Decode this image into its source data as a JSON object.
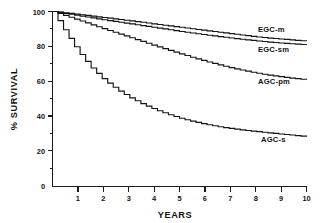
{
  "chart_data": {
    "type": "line",
    "title": "",
    "subtitle": "",
    "xlabel": "YEARS",
    "ylabel": "% SURVIVAL",
    "xlim": [
      0,
      10
    ],
    "ylim": [
      0,
      100
    ],
    "grid": false,
    "legend_position": "inline-right-of-curves",
    "x_ticks": [
      "1",
      "2",
      "3",
      "4",
      "5",
      "6",
      "7",
      "8",
      "9",
      "10"
    ],
    "x_tick_values": [
      1,
      2,
      3,
      4,
      5,
      6,
      7,
      8,
      9,
      10
    ],
    "y_ticks": [
      "0",
      "20",
      "40",
      "60",
      "80",
      "100"
    ],
    "y_tick_values": [
      0,
      20,
      40,
      60,
      80,
      100
    ],
    "y_minor_tick_values": [
      10,
      30,
      50,
      70,
      90
    ],
    "x": [
      0,
      0.5,
      1,
      1.5,
      2,
      2.5,
      3,
      3.5,
      4,
      4.5,
      5,
      5.5,
      6,
      6.5,
      7,
      7.5,
      8,
      8.5,
      9,
      9.5,
      10
    ],
    "series": [
      {
        "name": "EGC-m",
        "label": "EGC-m",
        "annotation_x": 8.1,
        "annotation_y": 90,
        "values": [
          100,
          99.2,
          98.3,
          97.4,
          96.5,
          95.6,
          94.7,
          93.8,
          92.8,
          91.9,
          91.0,
          90.0,
          89.1,
          88.2,
          87.3,
          86.4,
          85.5,
          84.8,
          84.2,
          83.6,
          83.0
        ]
      },
      {
        "name": "EGC-sm",
        "label": "EGC-sm",
        "annotation_x": 8.1,
        "annotation_y": 78,
        "values": [
          100,
          98.8,
          97.6,
          96.4,
          95.2,
          94.1,
          93.0,
          91.9,
          90.8,
          89.7,
          88.6,
          87.6,
          86.6,
          85.7,
          84.8,
          84.0,
          83.2,
          82.5,
          81.9,
          81.4,
          81.0
        ]
      },
      {
        "name": "AGC-pm",
        "label": "AGC-pm",
        "annotation_x": 8.1,
        "annotation_y": 60,
        "values": [
          100,
          97.5,
          95.0,
          92.5,
          90.0,
          87.6,
          85.2,
          82.8,
          80.4,
          78.1,
          75.8,
          73.6,
          71.5,
          69.6,
          67.8,
          66.2,
          64.8,
          63.6,
          62.6,
          61.7,
          61.0
        ]
      },
      {
        "name": "AGC-s",
        "label": "AGC-s",
        "annotation_x": 8.3,
        "annotation_y": 18,
        "values": [
          100,
          88.0,
          77.0,
          68.0,
          61.0,
          55.5,
          51.0,
          47.2,
          44.0,
          41.3,
          39.0,
          37.1,
          35.5,
          34.2,
          33.1,
          32.2,
          31.4,
          30.6,
          29.9,
          29.2,
          28.5
        ]
      }
    ],
    "colors": {
      "axis": "#1a1a1a",
      "curve": "#141414",
      "background": "#ffffff"
    }
  }
}
